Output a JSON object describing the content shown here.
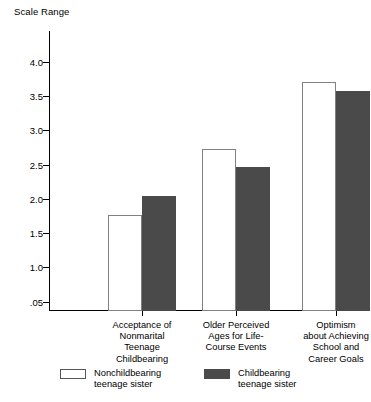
{
  "chart_data": {
    "type": "bar",
    "title": "",
    "ylabel": "Scale Range",
    "xlabel": "",
    "ylim": [
      0,
      4.0
    ],
    "grid": false,
    "legend_position": "bottom",
    "ytick_labels": [
      "4.0",
      "3.5",
      "3.0",
      "2.5",
      "2.0",
      "1.5",
      "1.0",
      ".05"
    ],
    "ytick_values": [
      4.0,
      3.5,
      3.0,
      2.5,
      2.0,
      1.5,
      1.0,
      0.5
    ],
    "categories": [
      "Acceptance of\nNonmarital\nTeenage\nChildbearing",
      "Older Perceived\nAges for Life-\nCourse Events",
      "Optimism\nabout Achieving\nSchool and\nCareer Goals"
    ],
    "series": [
      {
        "name": "Nonchildbearing\nteenage sister",
        "color": "#ffffff",
        "edge_color": "#808080",
        "values": [
          1.76,
          2.72,
          3.7
        ]
      },
      {
        "name": "Childbearing\nteenage sister",
        "color": "#4a4a4a",
        "edge_color": "#4a4a4a",
        "values": [
          2.04,
          2.46,
          3.57
        ]
      }
    ]
  },
  "axis": {
    "y_title": "Scale Range"
  },
  "legend": {
    "entries": [
      {
        "label": "Nonchildbearing\nteenage sister",
        "swatch": "light"
      },
      {
        "label": "Childbearing\nteenage sister",
        "swatch": "dark"
      }
    ]
  }
}
